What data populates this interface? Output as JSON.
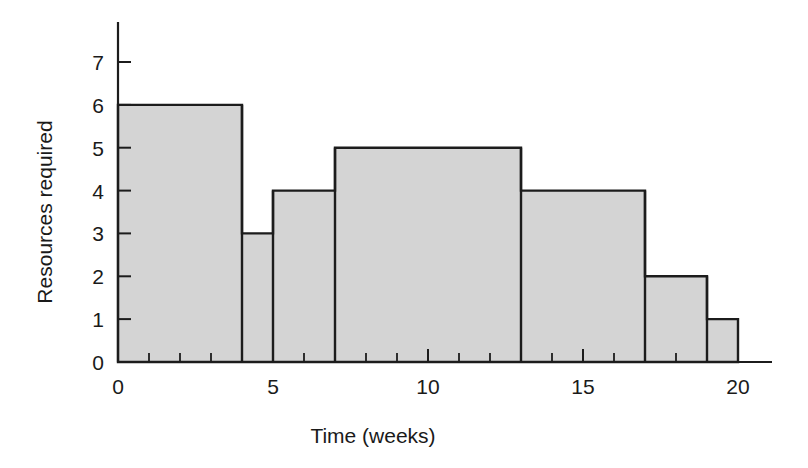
{
  "chart_data": {
    "type": "bar",
    "title": "",
    "xlabel": "Time (weeks)",
    "ylabel": "Resources required",
    "xlim": [
      0,
      20
    ],
    "ylim": [
      0,
      7
    ],
    "grid": false,
    "legend": "none",
    "x_ticks_major": [
      0,
      5,
      10,
      15,
      20
    ],
    "x_tick_labels": [
      "0",
      "5",
      "10",
      "15",
      "20"
    ],
    "x_ticks_minor": [
      1,
      2,
      3,
      4,
      6,
      7,
      8,
      9,
      11,
      12,
      13,
      14,
      16,
      17,
      18,
      19
    ],
    "y_ticks": [
      0,
      1,
      2,
      3,
      4,
      5,
      6,
      7
    ],
    "y_tick_labels": [
      "0",
      "1",
      "2",
      "3",
      "4",
      "5",
      "6",
      "7"
    ],
    "bar_fill_color": "#d4d4d4",
    "bar_edge_color": "#1c1c1c",
    "categories": [
      "0-4",
      "4-5",
      "5-7",
      "7-13",
      "13-17",
      "17-19",
      "19-20"
    ],
    "values": [
      6,
      3,
      4,
      5,
      4,
      2,
      1
    ],
    "steps": [
      {
        "x_start": 0,
        "x_end": 4,
        "value": 6
      },
      {
        "x_start": 4,
        "x_end": 5,
        "value": 3
      },
      {
        "x_start": 5,
        "x_end": 7,
        "value": 4
      },
      {
        "x_start": 7,
        "x_end": 13,
        "value": 5
      },
      {
        "x_start": 13,
        "x_end": 17,
        "value": 4
      },
      {
        "x_start": 17,
        "x_end": 19,
        "value": 2
      },
      {
        "x_start": 19,
        "x_end": 20,
        "value": 1
      }
    ]
  }
}
